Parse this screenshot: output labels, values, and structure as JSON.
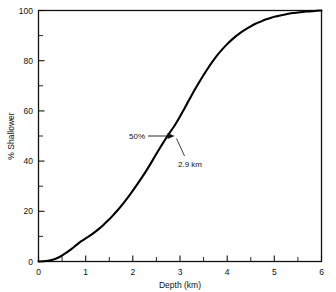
{
  "chart_data": {
    "type": "line",
    "title": "",
    "subtitle": "",
    "xlabel": "Depth (km)",
    "ylabel": "% Shallower",
    "xlim": [
      0,
      6
    ],
    "ylim": [
      0,
      100
    ],
    "grid": false,
    "legend": null,
    "x_major_ticks": [
      "0",
      "1",
      "2",
      "3",
      "4",
      "5",
      "6"
    ],
    "x_major_values": [
      0,
      1,
      2,
      3,
      4,
      5,
      6
    ],
    "x_minor_values": [
      0.5,
      1.5,
      2.5,
      3.5,
      4.5,
      5.5
    ],
    "y_major_ticks": [
      "0",
      "20",
      "40",
      "60",
      "80",
      "100"
    ],
    "y_major_values": [
      0,
      20,
      40,
      60,
      80,
      100
    ],
    "y_minor_values": [
      10,
      30,
      50,
      70,
      90
    ],
    "series": [
      {
        "name": "Cumulative % shallower",
        "x": [
          0.0,
          0.1,
          0.2,
          0.3,
          0.4,
          0.5,
          0.6,
          0.7,
          0.8,
          0.9,
          1.0,
          1.1,
          1.2,
          1.3,
          1.4,
          1.5,
          1.6,
          1.7,
          1.8,
          1.9,
          2.0,
          2.1,
          2.2,
          2.3,
          2.4,
          2.5,
          2.6,
          2.7,
          2.8,
          2.9,
          3.0,
          3.1,
          3.2,
          3.3,
          3.4,
          3.5,
          3.6,
          3.7,
          3.8,
          3.9,
          4.0,
          4.1,
          4.2,
          4.3,
          4.4,
          4.5,
          4.6,
          4.7,
          4.8,
          4.9,
          5.0,
          5.1,
          5.2,
          5.3,
          5.4,
          5.5,
          5.6,
          5.7,
          5.8,
          5.9,
          6.0
        ],
        "y": [
          0.0,
          0.1,
          0.3,
          0.7,
          1.4,
          2.4,
          3.6,
          5.0,
          6.5,
          8.0,
          9.2,
          10.4,
          11.8,
          13.3,
          15.0,
          16.8,
          18.8,
          20.9,
          23.2,
          25.6,
          28.2,
          30.9,
          33.7,
          36.6,
          39.7,
          42.9,
          46.0,
          49.0,
          51.8,
          54.6,
          57.8,
          61.2,
          64.6,
          68.0,
          71.2,
          74.3,
          77.2,
          79.9,
          82.4,
          84.6,
          86.6,
          88.4,
          90.0,
          91.4,
          92.6,
          93.7,
          94.7,
          95.5,
          96.3,
          96.9,
          97.5,
          97.9,
          98.3,
          98.7,
          99.0,
          99.2,
          99.4,
          99.6,
          99.7,
          99.9,
          100.0
        ]
      }
    ],
    "annotations": [
      {
        "name": "median-percent",
        "label": "50%",
        "x": 2.9,
        "y": 50
      },
      {
        "name": "median-depth",
        "label": "2.9 km",
        "x": 2.9,
        "y": 50
      }
    ]
  }
}
